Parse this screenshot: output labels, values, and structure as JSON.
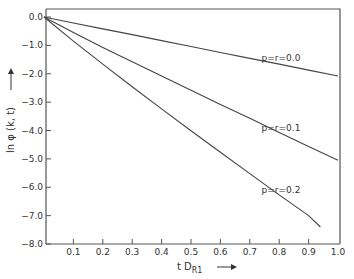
{
  "chart_data": {
    "type": "line",
    "title": "",
    "xlabel": "t D_R1",
    "ylabel": "ln φ (k, t)",
    "xlim": [
      0.0,
      1.0
    ],
    "ylim": [
      -8.0,
      0.0
    ],
    "grid": false,
    "legend_position": "inline labels near curves",
    "x_ticks": [
      "0.1",
      "0.2",
      "0.3",
      "0.4",
      "0.5",
      "0.6",
      "0.7",
      "0.8",
      "0.9",
      "1.0"
    ],
    "y_ticks": [
      "0.0",
      "-1.0",
      "-2.0",
      "-3.0",
      "-4.0",
      "-5.0",
      "-6.0",
      "-7.0",
      "-8.0"
    ],
    "series": [
      {
        "name": "p=r=0.0",
        "x": [
          0.0,
          0.1,
          0.2,
          0.3,
          0.4,
          0.5,
          0.6,
          0.7,
          0.8,
          0.9,
          1.0
        ],
        "y": [
          0.0,
          -0.21,
          -0.42,
          -0.62,
          -0.83,
          -1.04,
          -1.25,
          -1.46,
          -1.66,
          -1.87,
          -2.08
        ]
      },
      {
        "name": "p=r=0.1",
        "x": [
          0.0,
          0.1,
          0.2,
          0.3,
          0.4,
          0.5,
          0.6,
          0.7,
          0.8,
          0.9,
          1.0
        ],
        "y": [
          0.0,
          -0.55,
          -1.07,
          -1.58,
          -2.08,
          -2.58,
          -3.08,
          -3.57,
          -4.07,
          -4.56,
          -5.05
        ]
      },
      {
        "name": "p=r=0.2",
        "x": [
          0.0,
          0.1,
          0.2,
          0.3,
          0.4,
          0.5,
          0.6,
          0.7,
          0.8,
          0.9,
          0.94
        ],
        "y": [
          0.0,
          -0.85,
          -1.66,
          -2.46,
          -3.24,
          -4.01,
          -4.77,
          -5.52,
          -6.27,
          -7.0,
          -7.4
        ]
      }
    ],
    "annotations": [
      {
        "text": "p=r=0.0",
        "x": 0.74,
        "y": -1.55
      },
      {
        "text": "p=r=0.1",
        "x": 0.74,
        "y": -4.0
      },
      {
        "text": "p=r=0.2",
        "x": 0.74,
        "y": -6.2
      }
    ]
  },
  "labels": {
    "x_axis_prefix": "t D",
    "x_axis_subscript": "R1",
    "y_axis": "ln φ (k, t)"
  }
}
